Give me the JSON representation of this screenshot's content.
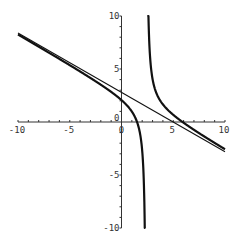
{
  "chart_data": {
    "type": "line",
    "title": "",
    "xlabel": "",
    "ylabel": "",
    "xlim": [
      -10,
      10
    ],
    "ylim": [
      -10,
      10
    ],
    "grid": false,
    "legend": null,
    "x_ticks": [
      -10,
      -5,
      0,
      5,
      10
    ],
    "y_ticks": [
      -10,
      -5,
      0,
      5,
      10
    ],
    "x_tick_labels": [
      "-10",
      "-5",
      "0",
      "5",
      "10"
    ],
    "y_tick_labels": [
      "-10",
      "-5",
      "0",
      "5",
      "10"
    ],
    "minor_tick_step": 1,
    "series": [
      {
        "name": "rational-function",
        "style": "thick",
        "description": "y = -0.56x + 2.8 + 1.76/(x - 2.4)",
        "slope": -0.56,
        "intercept": 2.8,
        "pole_coefficient": 1.76,
        "vertical_asymptote": 2.4,
        "sample_points": [
          {
            "x": -10,
            "y": 8.26
          },
          {
            "x": -5,
            "y": 5.36
          },
          {
            "x": 0,
            "y": 2.07
          },
          {
            "x": 1.5,
            "y": 0.0
          },
          {
            "x": 2.2,
            "y": -7.2
          },
          {
            "x": 2.6,
            "y": 10.1
          },
          {
            "x": 3,
            "y": 4.05
          },
          {
            "x": 5.6,
            "y": 0.21
          },
          {
            "x": 10,
            "y": -2.57
          }
        ]
      },
      {
        "name": "oblique-asymptote",
        "style": "thin",
        "description": "y = -0.56x + 2.8",
        "slope": -0.56,
        "intercept": 2.8,
        "sample_points": [
          {
            "x": -10,
            "y": 8.4
          },
          {
            "x": 0,
            "y": 2.8
          },
          {
            "x": 5,
            "y": 0.0
          },
          {
            "x": 10,
            "y": -2.8
          }
        ]
      }
    ]
  },
  "layout": {
    "origin_px": [
      121.5,
      122
    ],
    "x_px_per_unit": 10.35,
    "y_px_per_unit": 10.6
  }
}
